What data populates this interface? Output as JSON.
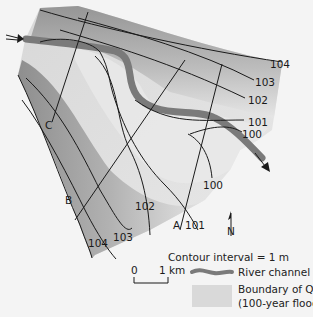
{
  "map": {
    "contour_labels_right": [
      "104",
      "103",
      "102",
      "101",
      "100"
    ],
    "contour_labels_bottom": [
      "104",
      "103",
      "102",
      "101",
      "100"
    ],
    "section_lines": [
      "A",
      "B",
      "C"
    ],
    "north_label": "N",
    "flow_direction": "inflow top-left, outflow bottom-right"
  },
  "legend": {
    "contour_interval": "Contour interval = 1 m",
    "scale_zero": "0",
    "scale_one": "1 km",
    "river_channel": "River channel",
    "boundary_prefix": "Boundary of Q",
    "boundary_sub": "100",
    "boundary_note": "(100-year flood)"
  },
  "colors": {
    "background": "#f4f4f4",
    "floodplain_light": "#e8e8e8",
    "floodplain_dark": "#9a9a9a",
    "river": "#7a7a7a",
    "contour": "#1a1a1a",
    "legend_swatch": "#d9d9d9"
  }
}
